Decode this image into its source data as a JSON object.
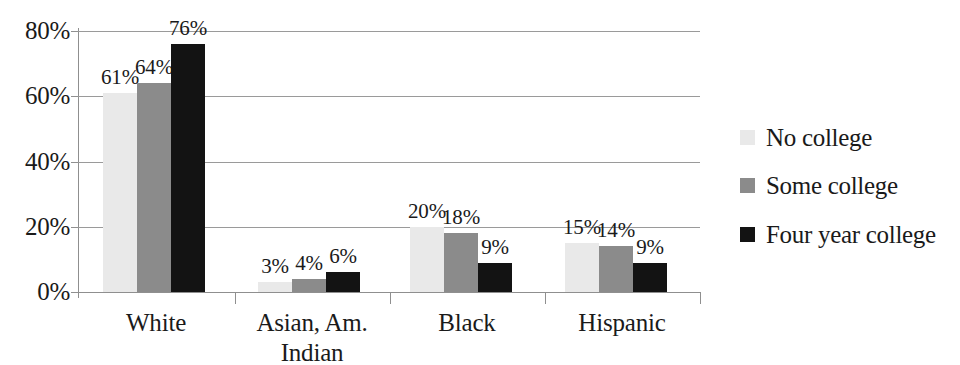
{
  "chart_data": {
    "type": "bar",
    "title": "",
    "subtitle": "",
    "xlabel": "",
    "ylabel": "",
    "categories": [
      "White",
      "Asian, Am.\nIndian",
      "Black",
      "Hispanic"
    ],
    "series": [
      {
        "name": "No college",
        "color": "#e9e9e9",
        "values": [
          61,
          3,
          20,
          15
        ]
      },
      {
        "name": "Some college",
        "color": "#8b8b8b",
        "values": [
          64,
          4,
          18,
          14
        ]
      },
      {
        "name": "Four year college",
        "color": "#131313",
        "values": [
          76,
          6,
          9,
          9
        ]
      }
    ],
    "value_labels": [
      [
        "61%",
        "64%",
        "76%"
      ],
      [
        "3%",
        "4%",
        "6%"
      ],
      [
        "20%",
        "18%",
        "9%"
      ],
      [
        "15%",
        "14%",
        "9%"
      ]
    ],
    "ylim": [
      0,
      80
    ],
    "yticks": [
      0,
      20,
      40,
      60,
      80
    ],
    "ytick_labels": [
      "0%",
      "20%",
      "40%",
      "60%",
      "80%"
    ],
    "grid": "horizontal",
    "legend_position": "right",
    "data_labels_shown": true,
    "value_unit": "%"
  }
}
